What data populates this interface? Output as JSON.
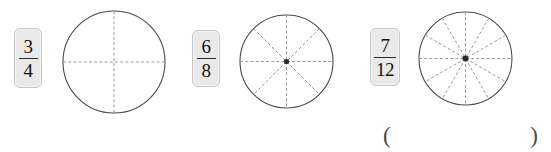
{
  "worksheet": {
    "title": "Fraction circles matching exercise",
    "background_color": "#ffffff"
  },
  "style": {
    "card_fill": "#e9e9e9",
    "card_border": "#c6c6c6",
    "circle_stroke": "#4a4a4a",
    "divider_stroke": "#9a9a9a",
    "center_dot": "#2b2b2b",
    "text_color": "#111111"
  },
  "groups": [
    {
      "id": "group-3-4",
      "label": "three fourths",
      "fraction": {
        "numerator": "3",
        "denominator": "4",
        "text": "3/4"
      },
      "circle": {
        "divisions": 4,
        "shaded_parts": 0,
        "has_center_dot": false,
        "radius": 52,
        "cx": 114,
        "cy": 62
      },
      "card": {
        "x": 14,
        "y": 28,
        "width": 28,
        "height": 60
      }
    },
    {
      "id": "group-6-8",
      "label": "six eighths",
      "fraction": {
        "numerator": "6",
        "denominator": "8",
        "text": "6/8"
      },
      "circle": {
        "divisions": 8,
        "shaded_parts": 0,
        "has_center_dot": true,
        "radius": 47,
        "cx": 286,
        "cy": 61
      },
      "card": {
        "x": 192,
        "y": 30,
        "width": 28,
        "height": 57
      }
    },
    {
      "id": "group-7-12",
      "label": "seven twelfths",
      "fraction": {
        "numerator": "7",
        "denominator": "12",
        "text": "7/12"
      },
      "circle": {
        "divisions": 12,
        "shaded_parts": 0,
        "has_center_dot": true,
        "radius": 47,
        "cx": 465,
        "cy": 58
      },
      "card": {
        "x": 370,
        "y": 28,
        "width": 30,
        "height": 58
      }
    }
  ],
  "answer_blank": {
    "open_paren": "(",
    "close_paren": ")",
    "value": "",
    "placeholder": ""
  }
}
